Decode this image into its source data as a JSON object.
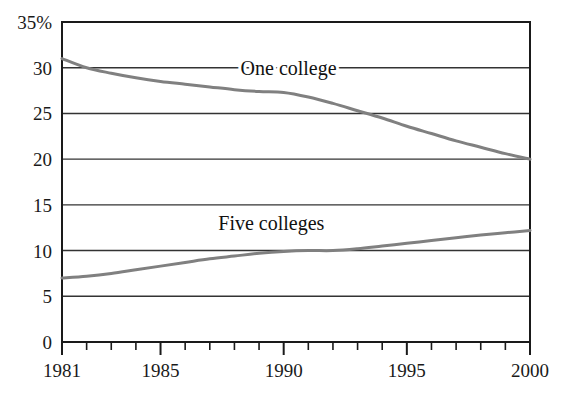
{
  "chart_data": {
    "type": "line",
    "title": "",
    "xlabel": "",
    "ylabel": "",
    "xlim": [
      1981,
      2000
    ],
    "ylim": [
      0,
      35
    ],
    "grid": true,
    "grid_axis": "y",
    "legend": "inline-labels",
    "y_ticks": [
      0,
      5,
      10,
      15,
      20,
      25,
      30,
      35
    ],
    "y_tick_labels": [
      "0",
      "5",
      "10",
      "15",
      "20",
      "25",
      "30",
      "35%"
    ],
    "x_ticks": [
      1981,
      1982,
      1983,
      1984,
      1985,
      1986,
      1987,
      1988,
      1989,
      1990,
      1991,
      1992,
      1993,
      1994,
      1995,
      1996,
      1997,
      1998,
      1999,
      2000
    ],
    "x_tick_labels_shown": [
      "1981",
      "1985",
      "1990",
      "1995",
      "2000"
    ],
    "x_labeled_ticks": [
      1981,
      1985,
      1990,
      1995,
      2000
    ],
    "x": [
      1981,
      1982,
      1983,
      1984,
      1985,
      1986,
      1987,
      1988,
      1989,
      1990,
      1991,
      1992,
      1993,
      1994,
      1995,
      1996,
      1997,
      1998,
      1999,
      2000
    ],
    "series": [
      {
        "name": "One college",
        "color": "#808080",
        "label_x": 1990.2,
        "label_y": 29.2,
        "values": [
          31.0,
          30.0,
          29.4,
          28.9,
          28.5,
          28.2,
          27.9,
          27.6,
          27.4,
          27.3,
          26.8,
          26.1,
          25.3,
          24.5,
          23.6,
          22.8,
          22.0,
          21.3,
          20.6,
          20.0
        ]
      },
      {
        "name": "Five colleges",
        "color": "#808080",
        "label_x": 1989.5,
        "label_y": 12.3,
        "values": [
          7.0,
          7.2,
          7.5,
          7.9,
          8.3,
          8.7,
          9.1,
          9.4,
          9.7,
          9.9,
          10.0,
          10.0,
          10.2,
          10.5,
          10.8,
          11.1,
          11.4,
          11.7,
          11.95,
          12.2
        ]
      }
    ],
    "axis_color": "#1a1a1a",
    "gridline_color": "#333333",
    "background": "#ffffff"
  }
}
